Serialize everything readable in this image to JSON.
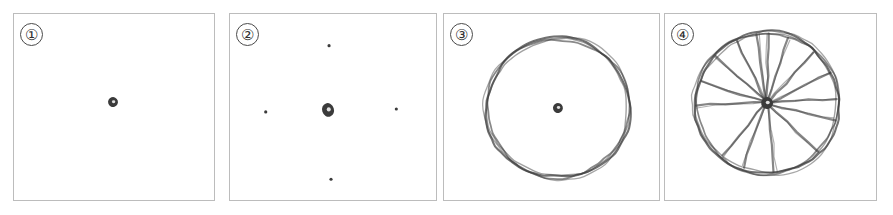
{
  "figure": {
    "background_color": "#ffffff",
    "panel_border_color": "#bcbcbc",
    "ink_color": "#3b3b3b",
    "panel_count": 4,
    "panels": [
      {
        "label": "①",
        "number": 1,
        "name": "hub-only",
        "caption": "Hub dot drawn alone at the center",
        "x": 13,
        "y": 13,
        "width": 202,
        "height": 188,
        "hub": {
          "cx": 100,
          "cy": 89,
          "rx": 5,
          "ry": 5
        },
        "dots": [],
        "rim": null,
        "spokes": []
      },
      {
        "label": "②",
        "number": 2,
        "name": "hub-with-four-reference-dots",
        "caption": "Hub plus four outer reference dots at top, left, right and bottom",
        "x": 229,
        "y": 13,
        "width": 208,
        "height": 188,
        "hub": {
          "cx": 99,
          "cy": 97,
          "rx": 6,
          "ry": 7
        },
        "dots": [
          {
            "cx": 100,
            "cy": 32,
            "r": 1.6
          },
          {
            "cx": 36,
            "cy": 99,
            "r": 1.6
          },
          {
            "cx": 168,
            "cy": 96,
            "r": 1.6
          },
          {
            "cx": 102,
            "cy": 167,
            "r": 1.6
          }
        ],
        "rim": null,
        "spokes": []
      },
      {
        "label": "③",
        "number": 3,
        "name": "hub-with-rim",
        "caption": "Outer rim circle sketched around the hub, no spokes yet",
        "x": 443,
        "y": 13,
        "width": 217,
        "height": 188,
        "hub": {
          "cx": 115,
          "cy": 95,
          "rx": 5,
          "ry": 5
        },
        "dots": [],
        "rim": {
          "cx": 115,
          "cy": 95,
          "rx": 73,
          "ry": 71,
          "stroke_passes": 3
        },
        "spokes": []
      },
      {
        "label": "④",
        "number": 4,
        "name": "complete-wheel-with-spokes",
        "caption": "Finished wheel: rim, hub and twelve spokes",
        "x": 664,
        "y": 13,
        "width": 213,
        "height": 188,
        "hub": {
          "cx": 103,
          "cy": 90,
          "rx": 6,
          "ry": 6
        },
        "dots": [],
        "rim": {
          "cx": 103,
          "cy": 90,
          "rx": 73,
          "ry": 72,
          "stroke_passes": 3
        },
        "spoke_count": 12,
        "spokes": [
          178,
          198,
          222,
          244,
          262,
          272,
          288,
          312,
          334,
          356,
          14,
          44,
          84,
          110,
          130
        ]
      }
    ]
  }
}
